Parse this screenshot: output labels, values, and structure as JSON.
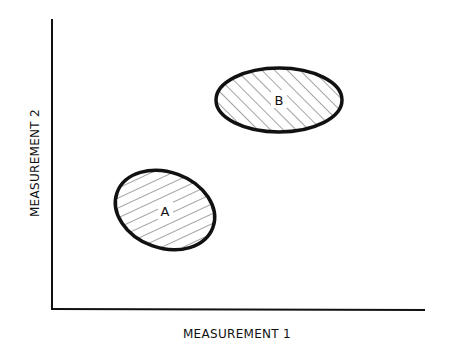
{
  "diagram": {
    "type": "scatter-clusters",
    "xlabel": "MEASUREMENT 1",
    "ylabel": "MEASUREMENT 2",
    "clusters": [
      {
        "label": "A",
        "cx": 165,
        "cy": 210,
        "rx": 51,
        "ry": 38,
        "rotate": 20,
        "fill": "hatched"
      },
      {
        "label": "B",
        "cx": 279,
        "cy": 100,
        "rx": 63,
        "ry": 32,
        "rotate": 0,
        "fill": "hatched"
      }
    ]
  }
}
